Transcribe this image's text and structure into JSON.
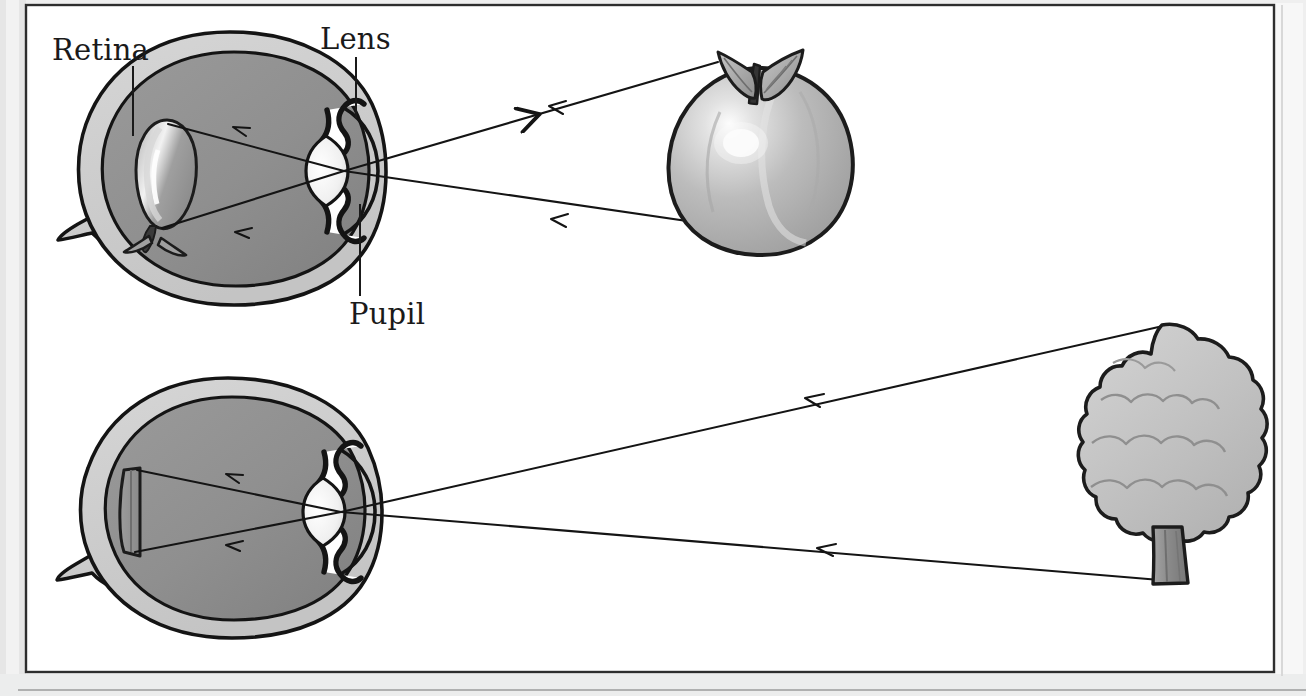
{
  "figure": {
    "title_alt": "Human eye forming inverted images of a nearby apple and a distant tree",
    "background_color": "#ffffff",
    "frame": {
      "outer_color": "#e8e8e8",
      "border_color": "#2b2b2b",
      "inner_fill": "#ffffff"
    },
    "labels": [
      {
        "name": "retina",
        "text": "Retina"
      },
      {
        "name": "lens",
        "text": "Lens"
      },
      {
        "name": "pupil",
        "text": "Pupil"
      }
    ],
    "colors": {
      "ink": "#1a1a1a",
      "sclera": "#cdcdcd",
      "vitreous": "#8f8f8f",
      "vitreous_dark": "#858585",
      "lens_fill": "#ececec",
      "retina_image": "#9a9a9a",
      "apple_body": "#b9b9b9",
      "apple_highlight": "#fdfdfd",
      "apple_leaf": "#a5a5a5",
      "apple_stem": "#3a3a3a",
      "tree_canopy": "#c2c2c2",
      "tree_trunk": "#8b8b8b"
    },
    "objects": [
      {
        "name": "eye-near",
        "label": "Eye viewing a near object",
        "object_viewed": "apple",
        "retina_image": "inverted apple",
        "ray_count": 2
      },
      {
        "name": "eye-far",
        "label": "Eye viewing a distant object",
        "object_viewed": "tree",
        "retina_image": "inverted tree (small)",
        "ray_count": 2
      }
    ],
    "ray_arrows": {
      "direction": "toward the eye",
      "count_per_eye": 2,
      "style": "open chevron arrowheads pointing left"
    }
  }
}
